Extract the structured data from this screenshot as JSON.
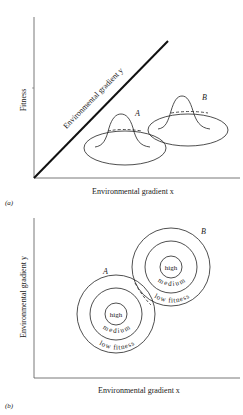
{
  "panel_a": {
    "label": "(a)",
    "y_axis_label": "Fitness",
    "x_axis_label": "Environmental gradient x",
    "diagonal_axis_label": "Environmental gradient y",
    "species": [
      {
        "name": "A"
      },
      {
        "name": "B"
      }
    ]
  },
  "panel_b": {
    "label": "(b)",
    "y_axis_label": "Environmental gradient y",
    "x_axis_label": "Environmental gradient x",
    "species": [
      {
        "name": "A",
        "zones": [
          "high",
          "medium",
          "low fitness"
        ]
      },
      {
        "name": "B",
        "zones": [
          "high",
          "medium",
          "low fitness"
        ]
      }
    ]
  }
}
